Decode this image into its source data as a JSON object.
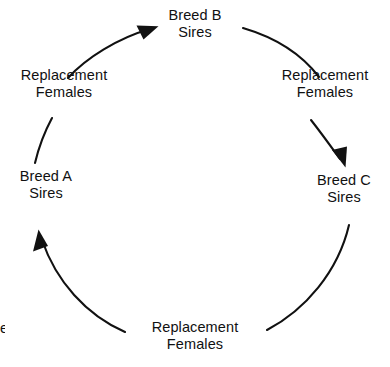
{
  "diagram": {
    "type": "three-breed-rotational-crossbreeding-cycle",
    "background_color": "#ffffff",
    "stroke_color": "#111111",
    "nodes": [
      {
        "id": "breed-b-sires",
        "line1": "Breed B",
        "line2": "Sires",
        "position": "top"
      },
      {
        "id": "breed-c-sires",
        "line1": "Breed C",
        "line2": "Sires",
        "position": "right"
      },
      {
        "id": "breed-a-sires",
        "line1": "Breed A",
        "line2": "Sires",
        "position": "left"
      }
    ],
    "edge_labels": [
      {
        "id": "replacement-females-top-left",
        "line1": "Replacement",
        "line2": "Females",
        "position": "upper-left"
      },
      {
        "id": "replacement-females-top-right",
        "line1": "Replacement",
        "line2": "Females",
        "position": "upper-right"
      },
      {
        "id": "replacement-females-bottom",
        "line1": "Replacement",
        "line2": "Females",
        "position": "bottom"
      }
    ],
    "edges": [
      {
        "id": "edge-b-to-c",
        "from": "breed-b-sires",
        "to": "replacement-females-top-right",
        "arrowhead": false
      },
      {
        "id": "edge-females-to-c",
        "from": "replacement-females-top-right",
        "to": "breed-c-sires",
        "arrowhead": true,
        "arrow_direction": "down"
      },
      {
        "id": "edge-c-to-bottom",
        "from": "breed-c-sires",
        "to": "replacement-females-bottom",
        "arrowhead": false
      },
      {
        "id": "edge-bottom-to-a",
        "from": "replacement-females-bottom",
        "to": "breed-a-sires",
        "arrowhead": true,
        "arrow_direction": "up"
      },
      {
        "id": "edge-a-to-top-left",
        "from": "breed-a-sires",
        "to": "replacement-females-top-left",
        "arrowhead": false
      },
      {
        "id": "edge-females-to-b",
        "from": "replacement-females-top-left",
        "to": "breed-b-sires",
        "arrowhead": true,
        "arrow_direction": "up-right"
      }
    ],
    "edge_fragment": "e"
  }
}
